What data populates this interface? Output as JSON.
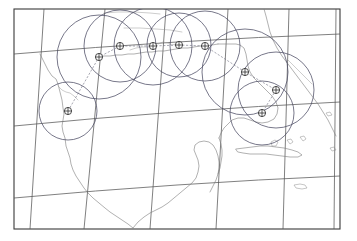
{
  "figure": {
    "background_color": "#ffffff",
    "frame_color": "#3a3a3a",
    "graticule_color": "#555555",
    "coastline_color": "#7c7c7c",
    "circle_color": "#4b4b63",
    "marker_color": "#2e2e2e",
    "track_color": "#6d6d7d"
  },
  "frame": {
    "x": 14,
    "y": 9,
    "width": 326,
    "height": 220
  },
  "graticule": {
    "meridians": [
      {
        "name": "meridian-1",
        "x_top": 44,
        "x_bottom": 30
      },
      {
        "name": "meridian-2",
        "x_top": 105,
        "x_bottom": 84
      },
      {
        "name": "meridian-3",
        "x_top": 166,
        "x_bottom": 150
      },
      {
        "name": "meridian-4",
        "x_top": 228,
        "x_bottom": 216
      },
      {
        "name": "meridian-5",
        "x_top": 289,
        "x_bottom": 283
      },
      {
        "name": "meridian-6",
        "x_top": 336,
        "x_bottom": 334
      }
    ],
    "parallels": [
      {
        "name": "parallel-1",
        "y_left": 54,
        "y_right": 34
      },
      {
        "name": "parallel-2",
        "y_left": 126,
        "y_right": 102
      },
      {
        "name": "parallel-3",
        "y_left": 198,
        "y_right": 176
      }
    ]
  },
  "chart_data": {
    "type": "scatter",
    "xlabel": "Longitude",
    "ylabel": "Latitude",
    "grid": true,
    "legend": "none",
    "marker_symbol": "circled-cross",
    "positions": [
      {
        "id": "pos-1",
        "x": 68,
        "y": 111,
        "radius": 29
      },
      {
        "id": "pos-2",
        "x": 99,
        "y": 57,
        "radius": 42
      },
      {
        "id": "pos-3",
        "x": 120,
        "y": 46,
        "radius": 36
      },
      {
        "id": "pos-4",
        "x": 153,
        "y": 46,
        "radius": 39
      },
      {
        "id": "pos-5",
        "x": 179,
        "y": 45,
        "radius": 32
      },
      {
        "id": "pos-6",
        "x": 205,
        "y": 46,
        "radius": 35
      },
      {
        "id": "pos-7",
        "x": 245,
        "y": 72,
        "radius": 43
      },
      {
        "id": "pos-8",
        "x": 276,
        "y": 90,
        "radius": 38
      },
      {
        "id": "pos-9",
        "x": 262,
        "y": 113,
        "radius": 32
      }
    ],
    "track": [
      [
        68,
        111
      ],
      [
        99,
        57
      ],
      [
        120,
        46
      ],
      [
        153,
        46
      ],
      [
        179,
        45
      ],
      [
        205,
        46
      ],
      [
        245,
        72
      ],
      [
        276,
        90
      ],
      [
        262,
        113
      ]
    ]
  }
}
